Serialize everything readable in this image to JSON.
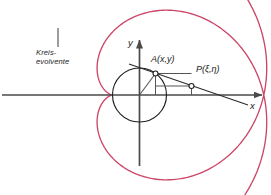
{
  "figure": {
    "background": "#ffffff",
    "width": 271,
    "height": 195
  },
  "colors": {
    "curve": "#cc4668",
    "axis": "#4a4a4a",
    "circle": "#1f1f1f",
    "construction": "#555555",
    "text": "#1a1a1a",
    "leader": "#3a3a3a"
  },
  "labels": {
    "curve_name_line1": "Kreis-",
    "curve_name_line2": "evolvente",
    "point_a": "A(x,y)",
    "point_p": "P(ξ,η)",
    "axis_y": "y",
    "axis_x": "x"
  },
  "geometry": {
    "origin": {
      "x": 139.5,
      "y": 95
    },
    "base_circle_radius": 27,
    "point_a": {
      "x": 155.5,
      "y": 73.5
    },
    "point_p": {
      "x": 191.5,
      "y": 86
    },
    "x_axis": {
      "x1": 2,
      "y1": 95,
      "x2": 262,
      "y2": 95
    },
    "y_axis": {
      "x1": 139.5,
      "y1": 166,
      "x2": 139.5,
      "y2": 40
    },
    "tangent_line": {
      "x1": 129,
      "y1": 64,
      "x2": 248,
      "y2": 105
    },
    "leader_line": {
      "x1": 58,
      "y1": 28,
      "x2": 58,
      "y2": 47
    },
    "involute": {
      "t_start": -6.1,
      "t_end": 6.1,
      "samples": 520,
      "description": "x = r(cos t + t sin t), y = r(sin t - t cos t)"
    }
  },
  "chart_data": {
    "type": "line",
    "xlabel": "x",
    "ylabel": "y",
    "annotations": [
      "Kreis-evolvente",
      "A(x,y)",
      "P(ξ,η)"
    ]
  }
}
